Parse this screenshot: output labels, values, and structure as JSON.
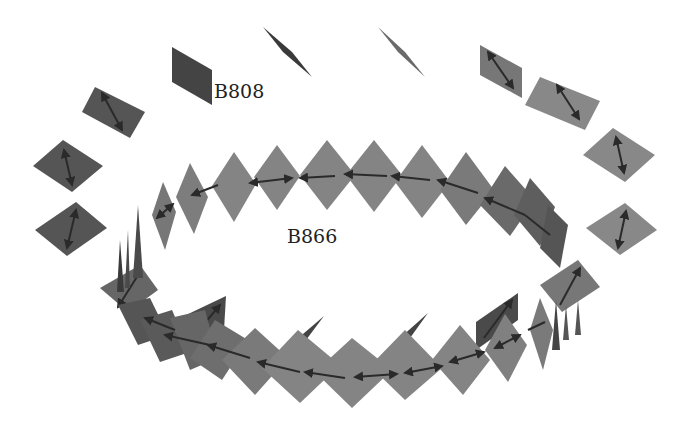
{
  "figure": {
    "labels": {
      "outer_ring": "B808",
      "inner_ring": "B866"
    },
    "colors": {
      "background": "#ffffff",
      "plane_light": "#7d7d7d",
      "plane_dark": "#555555",
      "arrow": "#2a2a2a",
      "text": "#222222"
    }
  }
}
